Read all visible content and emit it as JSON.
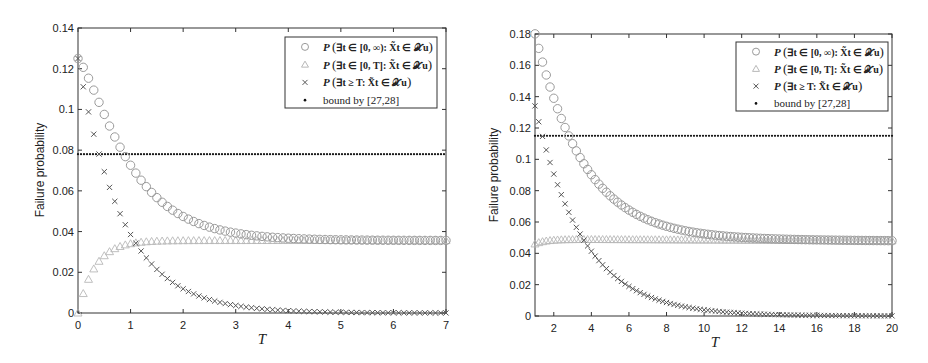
{
  "chart_data": [
    {
      "type": "scatter",
      "title": "",
      "xlabel": "T",
      "ylabel": "Failure probability",
      "xlim": [
        0,
        7
      ],
      "ylim": [
        0,
        0.14
      ],
      "xticks": [
        "0",
        "1",
        "2",
        "3",
        "4",
        "5",
        "6",
        "7"
      ],
      "yticks": [
        "0",
        "0.02",
        "0.04",
        "0.06",
        "0.08",
        "0.1",
        "0.12",
        "0.14"
      ],
      "grid": false,
      "legend_position": "upper right",
      "legend": [
        "P(∃t ∈ [0,∞): X̃t ∈ Xu)",
        "P(∃t ∈ [0,T]: X̃t ∈ Xu)",
        "P(∃t ≥ T: X̃t ∈ Xu)",
        "bound by [27,28]"
      ],
      "x_step": 0.1,
      "x": [
        0,
        0.1,
        0.2,
        0.3,
        0.4,
        0.5,
        0.6,
        0.7,
        0.8,
        0.9,
        1.0,
        1.2,
        1.4,
        1.6,
        1.8,
        2.0,
        2.5,
        3.0,
        3.5,
        4.0,
        4.5,
        5.0,
        5.5,
        6.0,
        6.5,
        7.0
      ],
      "series": [
        {
          "name": "P(∃t ∈ [0,∞): X̃t ∈ Xu)",
          "marker": "circle",
          "color": "#9a9a9a",
          "values": [
            0.125,
            0.117,
            0.115,
            0.112,
            0.108,
            0.103,
            0.097,
            0.092,
            0.087,
            0.082,
            0.078,
            0.071,
            0.065,
            0.059,
            0.055,
            0.052,
            0.046,
            0.042,
            0.039,
            0.037,
            0.0365,
            0.036,
            0.036,
            0.0358,
            0.0357,
            0.0356
          ]
        },
        {
          "name": "P(∃t ∈ [0,T]: X̃t ∈ Xu)",
          "marker": "triangle",
          "color": "#b8b8b8",
          "values": [
            0.0,
            0.004,
            0.011,
            0.019,
            0.024,
            0.027,
            0.029,
            0.03,
            0.031,
            0.032,
            0.0325,
            0.0335,
            0.034,
            0.0345,
            0.035,
            0.0352,
            0.0355,
            0.0356,
            0.0356,
            0.0356,
            0.0356,
            0.0356,
            0.0356,
            0.0356,
            0.0356,
            0.0356
          ]
        },
        {
          "name": "P(∃t ≥ T: X̃t ∈ Xu)",
          "marker": "x",
          "color": "#555555",
          "values": [
            0.125,
            0.113,
            0.102,
            0.092,
            0.084,
            0.076,
            0.068,
            0.062,
            0.056,
            0.051,
            0.046,
            0.037,
            0.031,
            0.025,
            0.02,
            0.017,
            0.01,
            0.0065,
            0.0035,
            0.0015,
            0.001,
            0.0005,
            0.0003,
            0.0002,
            0.0001,
            0.0
          ]
        },
        {
          "name": "bound by [27,28]",
          "marker": "dot",
          "color": "#111111",
          "values_constant": 0.078
        }
      ]
    },
    {
      "type": "scatter",
      "title": "",
      "xlabel": "T",
      "ylabel": "Failure probability",
      "xlim": [
        1,
        20
      ],
      "ylim": [
        0,
        0.18
      ],
      "xticks": [
        "2",
        "4",
        "6",
        "8",
        "10",
        "12",
        "14",
        "16",
        "18",
        "20"
      ],
      "yticks": [
        "0",
        "0.02",
        "0.04",
        "0.06",
        "0.08",
        "0.1",
        "0.12",
        "0.14",
        "0.16",
        "0.18"
      ],
      "grid": false,
      "legend_position": "upper right",
      "legend": [
        "P(∃t ∈ [0,∞): X̃t ∈ Xu)",
        "P(∃t ∈ [0,T]: X̃t ∈ Xu)",
        "P(∃t ≥ T: X̃t ∈ Xu)",
        "bound by [27,28]"
      ],
      "x_step": 0.2,
      "x": [
        1,
        1.2,
        1.4,
        1.6,
        1.8,
        2,
        2.5,
        3,
        3.5,
        4,
        5,
        6,
        7,
        8,
        9,
        10,
        12,
        14,
        16,
        18,
        20
      ],
      "series": [
        {
          "name": "P(∃t ∈ [0,∞): X̃t ∈ Xu)",
          "marker": "circle",
          "color": "#9a9a9a",
          "values": [
            0.18,
            0.17,
            0.161,
            0.153,
            0.145,
            0.138,
            0.122,
            0.108,
            0.099,
            0.091,
            0.078,
            0.068,
            0.062,
            0.058,
            0.055,
            0.052,
            0.05,
            0.049,
            0.0485,
            0.048,
            0.048
          ]
        },
        {
          "name": "P(∃t ∈ [0,T]: X̃t ∈ Xu)",
          "marker": "triangle",
          "color": "#b8b8b8",
          "values": [
            0.046,
            0.047,
            0.048,
            0.0485,
            0.049,
            0.049,
            0.049,
            0.049,
            0.049,
            0.049,
            0.0488,
            0.0485,
            0.0483,
            0.0482,
            0.048,
            0.048,
            0.048,
            0.048,
            0.048,
            0.048,
            0.048
          ]
        },
        {
          "name": "P(∃t ≥ T: X̃t ∈ Xu)",
          "marker": "x",
          "color": "#555555",
          "values": [
            0.134,
            0.123,
            0.114,
            0.105,
            0.097,
            0.089,
            0.073,
            0.06,
            0.05,
            0.042,
            0.029,
            0.02,
            0.013,
            0.009,
            0.006,
            0.004,
            0.002,
            0.001,
            0.0005,
            0.0002,
            0.0
          ]
        },
        {
          "name": "bound by [27,28]",
          "marker": "dot",
          "color": "#111111",
          "values_constant": 0.115
        }
      ]
    }
  ],
  "plots": [
    {
      "ylabel": "Failure probability",
      "xlabel": "T",
      "legend": {
        "pre": [
          "P",
          "P",
          "P",
          ""
        ],
        "math": [
          "∃t ∈ [0, ∞): X̃t ∈ 𝒳u",
          "∃t ∈ [0, T]: X̃t ∈ 𝒳u",
          "∃t ≥ T: X̃t ∈ 𝒳u",
          ""
        ],
        "bound": "bound by [27,28]"
      }
    },
    {
      "ylabel": "Failure probability",
      "xlabel": "T",
      "legend": {
        "pre": [
          "P",
          "P",
          "P",
          ""
        ],
        "math": [
          "∃t ∈ [0, ∞): X̃t ∈ 𝒳u",
          "∃t ∈ [0, T]: X̃t ∈ 𝒳u",
          "∃t ≥ T: X̃t ∈ 𝒳u",
          ""
        ],
        "bound": "bound by [27,28]"
      }
    }
  ],
  "model": [
    {
      "a0": 0.125,
      "cinf": 0.0356,
      "tau_c": 1.0,
      "tri_tau": 0.32,
      "x_tau": 0.85,
      "xmin": 0,
      "xmax": 7,
      "step": 0.1,
      "bound": 0.078
    },
    {
      "a0": 0.18,
      "cinf": 0.048,
      "tau_c": 2.3,
      "tri_tau": 0.6,
      "x_tau": 2.55,
      "xmin": 1,
      "xmax": 20,
      "step": 0.2,
      "bound": 0.115
    }
  ]
}
